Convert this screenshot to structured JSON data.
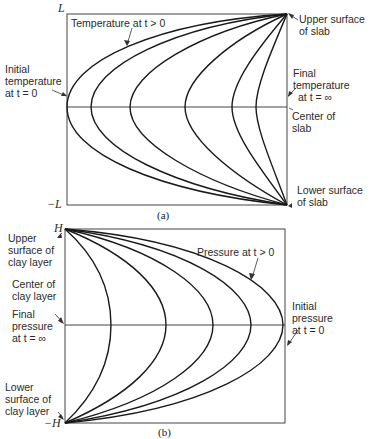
{
  "panel_a": {
    "caption": "(a)",
    "y_top_label": "L",
    "y_bottom_label": "−L",
    "labels": {
      "curves": "Temperature at t > 0",
      "initial_l1": "Initial",
      "initial_l2": "temperature",
      "initial_l3": "at t = 0",
      "upper_l1": "Upper surface",
      "upper_l2": "of slab",
      "final_l1": "Final",
      "final_l2": "temperature",
      "final_l3": "at t = ∞",
      "center_l1": "Center of",
      "center_l2": "slab",
      "lower_l1": "Lower surface",
      "lower_l2": "of slab"
    }
  },
  "panel_b": {
    "caption": "(b)",
    "y_top_label": "H",
    "y_bottom_label": "−H",
    "labels": {
      "curves": "Pressure at t > 0",
      "upper_l1": "Upper",
      "upper_l2": "surface of",
      "upper_l3": "clay layer",
      "center_l1": "Center of",
      "center_l2": "clay layer",
      "final_l1": "Final",
      "final_l2": "pressure",
      "final_l3": "at t = ∞",
      "lower_l1": "Lower",
      "lower_l2": "surface of",
      "lower_l3": "clay layer",
      "initial_l1": "Initial",
      "initial_l2": "pressure",
      "initial_l3": "at t = 0"
    }
  },
  "colors": {
    "line": "#1a1a1a",
    "frame": "#444444"
  }
}
